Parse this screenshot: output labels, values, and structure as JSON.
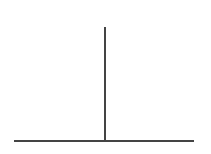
{
  "diagram": {
    "line_color": "#444444",
    "background": "#ffffff",
    "baseline": {
      "x1": 14,
      "x2": 194,
      "y": 141,
      "thickness": 2
    },
    "vertical": {
      "x": 105,
      "y1": 27,
      "y2": 141,
      "thickness": 2
    }
  }
}
